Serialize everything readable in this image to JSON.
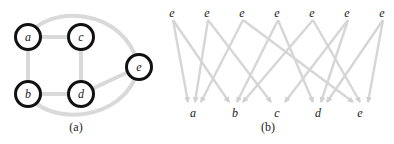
{
  "figure_a": {
    "caption": "(a)",
    "nodes": [
      {
        "id": "a",
        "label": "a",
        "x": 28,
        "y": 37
      },
      {
        "id": "c",
        "label": "c",
        "x": 81,
        "y": 37
      },
      {
        "id": "b",
        "label": "b",
        "x": 28,
        "y": 94
      },
      {
        "id": "d",
        "label": "d",
        "x": 81,
        "y": 94
      },
      {
        "id": "e",
        "label": "e",
        "x": 139,
        "y": 67
      }
    ],
    "edges": [
      [
        "a",
        "c"
      ],
      [
        "a",
        "b"
      ],
      [
        "c",
        "d"
      ],
      [
        "b",
        "d"
      ],
      [
        "d",
        "e"
      ],
      [
        "a",
        "e"
      ],
      [
        "b",
        "e"
      ]
    ],
    "colors": {
      "edge": "#d9d9d9",
      "node_stroke": "#111111"
    }
  },
  "figure_b": {
    "caption": "(b)",
    "top_nodes": [
      {
        "label": "e",
        "x": 172
      },
      {
        "label": "e",
        "x": 207
      },
      {
        "label": "e",
        "x": 242
      },
      {
        "label": "e",
        "x": 277
      },
      {
        "label": "e",
        "x": 312
      },
      {
        "label": "e",
        "x": 347
      },
      {
        "label": "e",
        "x": 382
      }
    ],
    "bottom_nodes": [
      {
        "label": "a",
        "x": 193
      },
      {
        "label": "b",
        "x": 235
      },
      {
        "label": "c",
        "x": 277
      },
      {
        "label": "d",
        "x": 318
      },
      {
        "label": "e",
        "x": 360
      }
    ],
    "arrows": [
      {
        "from": 0,
        "to": [
          "a",
          "b"
        ]
      },
      {
        "from": 1,
        "to": [
          "a",
          "c"
        ]
      },
      {
        "from": 2,
        "to": [
          "a",
          "e"
        ]
      },
      {
        "from": 3,
        "to": [
          "b",
          "d"
        ]
      },
      {
        "from": 4,
        "to": [
          "b",
          "e"
        ]
      },
      {
        "from": 5,
        "to": [
          "c",
          "d"
        ]
      },
      {
        "from": 6,
        "to": [
          "d",
          "e"
        ]
      }
    ],
    "colors": {
      "arrow": "#d6d6d6"
    }
  }
}
